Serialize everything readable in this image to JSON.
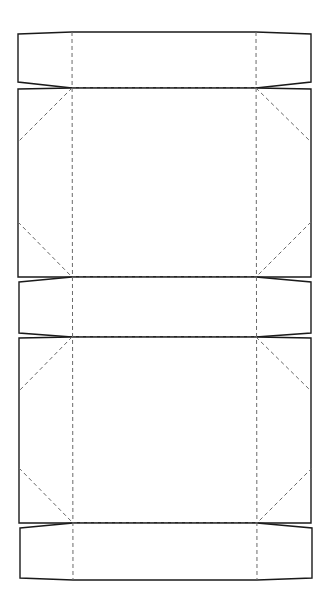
{
  "diagram": {
    "type": "box-dieline",
    "width": 331,
    "height": 607,
    "colors": {
      "cut_line": "#1a1a1a",
      "fold_line": "#6a6a6a",
      "background": "#ffffff"
    },
    "cut_shapes": [
      {
        "name": "top-tuck-flap",
        "points": "18,34 72,32 256,32 311,34 311,82 256,88 72,88 18,82"
      },
      {
        "name": "top-panel",
        "points": "18,89 72,88 256,88 311,89 311,277 256,277 72,277 18,277"
      },
      {
        "name": "middle-flap",
        "points": "19,282 72,277 256,277 311,282 311,333 256,337 72,337 19,333"
      },
      {
        "name": "bottom-panel",
        "points": "19,338 72,337 256,337 311,338 311,523 256,523 72,523 19,523"
      },
      {
        "name": "bottom-tuck-flap",
        "points": "20,528 73,523 257,523 312,528 312,578 257,580 73,580 20,578"
      }
    ],
    "fold_lines": [
      {
        "name": "left-vertical-fold",
        "x1": 72,
        "y1": 32,
        "x2": 73,
        "y2": 580
      },
      {
        "name": "right-vertical-fold",
        "x1": 256,
        "y1": 32,
        "x2": 257,
        "y2": 580
      },
      {
        "name": "fold-top-flap-panel",
        "x1": 72,
        "y1": 88,
        "x2": 256,
        "y2": 88
      },
      {
        "name": "fold-top-panel-middle",
        "x1": 72,
        "y1": 277,
        "x2": 256,
        "y2": 277
      },
      {
        "name": "fold-middle-bottom-panel",
        "x1": 72,
        "y1": 337,
        "x2": 256,
        "y2": 337
      },
      {
        "name": "fold-bottom-panel-flap",
        "x1": 73,
        "y1": 523,
        "x2": 257,
        "y2": 523
      },
      {
        "name": "diag-top-left-upper",
        "x1": 72,
        "y1": 88,
        "x2": 18,
        "y2": 142
      },
      {
        "name": "diag-top-left-lower",
        "x1": 18,
        "y1": 222,
        "x2": 72,
        "y2": 277
      },
      {
        "name": "diag-top-right-upper",
        "x1": 256,
        "y1": 88,
        "x2": 311,
        "y2": 142
      },
      {
        "name": "diag-top-right-lower",
        "x1": 311,
        "y1": 222,
        "x2": 256,
        "y2": 277
      },
      {
        "name": "diag-bottom-left-upper",
        "x1": 72,
        "y1": 337,
        "x2": 19,
        "y2": 391
      },
      {
        "name": "diag-bottom-left-lower",
        "x1": 19,
        "y1": 468,
        "x2": 73,
        "y2": 523
      },
      {
        "name": "diag-bottom-right-upper",
        "x1": 256,
        "y1": 337,
        "x2": 311,
        "y2": 391
      },
      {
        "name": "diag-bottom-right-lower",
        "x1": 312,
        "y1": 468,
        "x2": 257,
        "y2": 523
      }
    ]
  }
}
